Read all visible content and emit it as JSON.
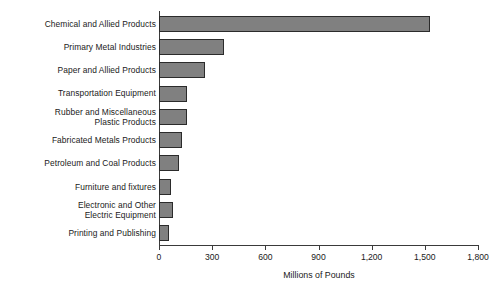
{
  "chart_data": {
    "type": "bar",
    "orientation": "horizontal",
    "title": "",
    "xlabel": "Millions of Pounds",
    "ylabel": "",
    "xlim": [
      0,
      1800
    ],
    "xticks": [
      0,
      300,
      600,
      900,
      1200,
      1500,
      1800
    ],
    "xtick_labels": [
      "0",
      "300",
      "600",
      "900",
      "1,200",
      "1,500",
      "1,800"
    ],
    "grid": false,
    "legend": false,
    "bar_fill_color": "#808080",
    "bar_edge_color": "#2b2b2b",
    "categories": [
      "Chemical and Allied Products",
      "Primary Metal Industries",
      "Paper and Allied Products",
      "Transportation Equipment",
      "Rubber and Miscellaneous\nPlastic Products",
      "Fabricated Metals Products",
      "Petroleum and Coal Products",
      "Furniture and fixtures",
      "Electronic and Other\nElectric Equipment",
      "Printing and Publishing"
    ],
    "values": [
      1530,
      367,
      260,
      158,
      158,
      130,
      113,
      68,
      79,
      56
    ]
  }
}
